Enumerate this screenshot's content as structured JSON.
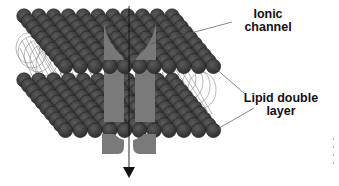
{
  "figure": {
    "labels": {
      "ionic_channel": {
        "line1": "Ionic",
        "line2": "channel"
      },
      "lipid_double_layer": {
        "line1": "Lipid double",
        "line2": "layer"
      }
    },
    "colors": {
      "lipid_head": "#3c3c3c",
      "lipid_head_stroke": "#1e1e1e",
      "lipid_tail": "#8a8a8a",
      "channel": "#7a7a7a",
      "arrow": "#111111",
      "leader_line": "#555555",
      "background": "#ffffff"
    },
    "arrow_direction": "down"
  }
}
